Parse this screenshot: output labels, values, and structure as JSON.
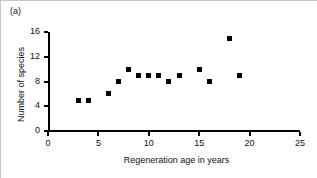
{
  "figure": {
    "panel_label": "(a)"
  },
  "chart_data": {
    "type": "scatter",
    "title": "",
    "xlabel": "Regeneration age in years",
    "ylabel": "Number of species",
    "xlim": [
      0,
      25
    ],
    "ylim": [
      0,
      16
    ],
    "xticks": [
      0,
      5,
      10,
      15,
      20,
      25
    ],
    "yticks": [
      0,
      4,
      8,
      12,
      16
    ],
    "xtick_labels": [
      "0",
      "5",
      "10",
      "15",
      "20",
      "25"
    ],
    "ytick_labels": [
      "0",
      "4",
      "8",
      "12",
      "16"
    ],
    "grid": false,
    "legend": null,
    "marker": "square",
    "marker_color": "#000000",
    "x": [
      3,
      4,
      6,
      7,
      8,
      9,
      10,
      11,
      12,
      13,
      15,
      16,
      18,
      19
    ],
    "y": [
      5,
      5,
      6,
      8,
      10,
      9,
      9,
      9,
      8,
      9,
      10,
      8,
      15,
      9
    ],
    "points": [
      {
        "x": 3,
        "y": 5
      },
      {
        "x": 4,
        "y": 5
      },
      {
        "x": 6,
        "y": 6
      },
      {
        "x": 7,
        "y": 8
      },
      {
        "x": 8,
        "y": 10
      },
      {
        "x": 9,
        "y": 9
      },
      {
        "x": 10,
        "y": 9
      },
      {
        "x": 11,
        "y": 9
      },
      {
        "x": 12,
        "y": 8
      },
      {
        "x": 13,
        "y": 9
      },
      {
        "x": 15,
        "y": 10
      },
      {
        "x": 16,
        "y": 8
      },
      {
        "x": 18,
        "y": 15
      },
      {
        "x": 19,
        "y": 9
      }
    ]
  }
}
